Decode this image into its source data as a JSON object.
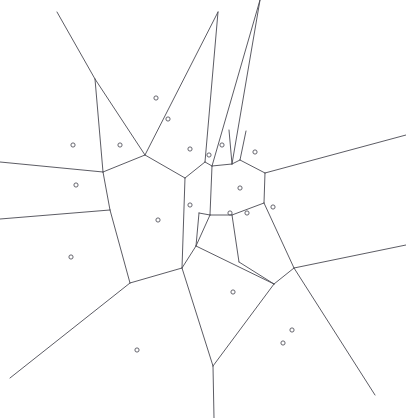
{
  "figure": {
    "name": "voronoi-diagram",
    "type": "voronoi-tessellation",
    "width": 406,
    "height": 418,
    "background_color": "#ffffff",
    "edge_color": "#4a4a52",
    "site_color": "#55555d",
    "edge_width": 0.9,
    "site_radius": 2.1,
    "site_count": 26,
    "edge_count": 42
  },
  "sites": [
    {
      "id": "s1",
      "x": 73,
      "y": 145
    },
    {
      "id": "s2",
      "x": 120,
      "y": 145
    },
    {
      "id": "s3",
      "x": 156,
      "y": 98
    },
    {
      "id": "s4",
      "x": 168,
      "y": 119
    },
    {
      "id": "s5",
      "x": 76,
      "y": 185
    },
    {
      "id": "s6",
      "x": 190,
      "y": 149
    },
    {
      "id": "s7",
      "x": 209,
      "y": 155
    },
    {
      "id": "s8",
      "x": 222,
      "y": 145
    },
    {
      "id": "s9",
      "x": 255,
      "y": 152
    },
    {
      "id": "s10",
      "x": 240,
      "y": 188
    },
    {
      "id": "s11",
      "x": 190,
      "y": 205
    },
    {
      "id": "s12",
      "x": 158,
      "y": 220
    },
    {
      "id": "s13",
      "x": 230,
      "y": 213
    },
    {
      "id": "s14",
      "x": 247,
      "y": 213
    },
    {
      "id": "s15",
      "x": 273,
      "y": 207
    },
    {
      "id": "s16",
      "x": 71,
      "y": 257
    },
    {
      "id": "s17",
      "x": 233,
      "y": 292
    },
    {
      "id": "s18",
      "x": 137,
      "y": 350
    },
    {
      "id": "s19",
      "x": 292,
      "y": 330
    },
    {
      "id": "s20",
      "x": 283,
      "y": 343
    }
  ],
  "edges": [
    {
      "id": "e1",
      "points": "57,12 95,79"
    },
    {
      "id": "e2",
      "points": "95,79 103,172"
    },
    {
      "id": "e3",
      "points": "95,79 145,155"
    },
    {
      "id": "e4",
      "points": "145,155 103,172"
    },
    {
      "id": "e5",
      "points": "0,162 103,172"
    },
    {
      "id": "e6",
      "points": "103,172 110,210"
    },
    {
      "id": "e7",
      "points": "110,210 0,219"
    },
    {
      "id": "e8",
      "points": "110,210 130,283"
    },
    {
      "id": "e9",
      "points": "130,283 10,378"
    },
    {
      "id": "e10",
      "points": "130,283 182,268"
    },
    {
      "id": "e11",
      "points": "145,155 185,178"
    },
    {
      "id": "e12",
      "points": "185,178 182,268"
    },
    {
      "id": "e13",
      "points": "182,268 196,246"
    },
    {
      "id": "e14",
      "points": "196,246 210,215"
    },
    {
      "id": "e15",
      "points": "145,155 218,12"
    },
    {
      "id": "e16",
      "points": "218,12 205,162"
    },
    {
      "id": "e17",
      "points": "185,178 205,162"
    },
    {
      "id": "e18",
      "points": "205,162 212,166"
    },
    {
      "id": "e19",
      "points": "212,166 260,0"
    },
    {
      "id": "e20",
      "points": "260,0 232,164"
    },
    {
      "id": "e21",
      "points": "232,164 212,166"
    },
    {
      "id": "e22",
      "points": "232,164 240,160"
    },
    {
      "id": "e23",
      "points": "240,160 265,173"
    },
    {
      "id": "e24",
      "points": "265,173 264,203"
    },
    {
      "id": "e25",
      "points": "264,203 232,215"
    },
    {
      "id": "e26",
      "points": "232,215 210,215"
    },
    {
      "id": "e27",
      "points": "210,215 212,166"
    },
    {
      "id": "e28",
      "points": "265,173 406,135"
    },
    {
      "id": "e29",
      "points": "264,203 294,268"
    },
    {
      "id": "e30",
      "points": "294,268 406,245"
    },
    {
      "id": "e31",
      "points": "294,268 274,284"
    },
    {
      "id": "e32",
      "points": "274,284 196,246"
    },
    {
      "id": "e33",
      "points": "232,215 239,262"
    },
    {
      "id": "e34",
      "points": "239,262 274,284"
    },
    {
      "id": "e35",
      "points": "274,284 213,366"
    },
    {
      "id": "e36",
      "points": "213,366 182,268"
    },
    {
      "id": "e37",
      "points": "213,366 214,418"
    },
    {
      "id": "e38",
      "points": "294,268 375,395"
    },
    {
      "id": "e39",
      "points": "240,160 246,131"
    },
    {
      "id": "e40",
      "points": "232,164 229,130"
    },
    {
      "id": "e41",
      "points": "196,246 199,213"
    },
    {
      "id": "e42",
      "points": "199,213 210,215"
    }
  ]
}
